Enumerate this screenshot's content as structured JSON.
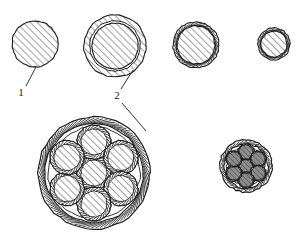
{
  "figure": {
    "background_color": "#ffffff",
    "line_color": "#1a1a1a",
    "hatch_color": "#2b2b2b",
    "strand_fill_light": "#ffffff",
    "strand_fill_dark": "#8e8e8e"
  },
  "callouts": [
    {
      "id": "callout-1",
      "label": "1",
      "label_x": 21,
      "label_y": 96,
      "leader": {
        "x1": 26,
        "y1": 86,
        "x2": 36,
        "y2": 67
      }
    },
    {
      "id": "callout-2",
      "label": "2",
      "label_x": 117,
      "label_y": 99,
      "leader_up": {
        "x1": 121,
        "y1": 89,
        "x2": 133,
        "y2": 70
      },
      "leader_down": {
        "x1": 122,
        "y1": 103,
        "x2": 146,
        "y2": 131
      }
    }
  ],
  "top_row": [
    {
      "id": "conductor-1",
      "name": "bare-conductor",
      "cx": 35,
      "cy": 44,
      "outer_r": 23,
      "core_r": 23,
      "has_sheath": false,
      "has_braid": false,
      "core_fill": "#ffffff"
    },
    {
      "id": "conductor-2",
      "name": "insulated-conductor",
      "cx": 115,
      "cy": 46,
      "outer_r": 31,
      "core_r": 23,
      "has_sheath": true,
      "has_braid": false,
      "core_fill": "#ffffff"
    },
    {
      "id": "conductor-3",
      "name": "braided-conductor-medium",
      "cx": 196,
      "cy": 45,
      "outer_r": 23,
      "core_r": 19,
      "has_sheath": false,
      "has_braid": true,
      "core_fill": "#ffffff"
    },
    {
      "id": "conductor-4",
      "name": "braided-conductor-small",
      "cx": 274,
      "cy": 44,
      "outer_r": 16,
      "core_r": 13,
      "has_sheath": false,
      "has_braid": true,
      "core_fill": "#ffffff"
    }
  ],
  "bottom_row": [
    {
      "id": "cable-large",
      "name": "seven-strand-cable-large",
      "cx": 94,
      "cy": 173,
      "outer_r": 56,
      "sheath_inner_r": 49,
      "strand_r": 17,
      "strand_core_r": 13,
      "ring_radius": 31,
      "strand_count": 7,
      "strand_fill": "#ffffff"
    },
    {
      "id": "cable-small",
      "name": "seven-strand-cable-small",
      "cx": 246,
      "cy": 166,
      "outer_r": 26,
      "sheath_inner_r": 22,
      "strand_r": 8,
      "strand_core_r": 7,
      "ring_radius": 14,
      "strand_count": 7,
      "strand_fill": "#8e8e8e"
    }
  ]
}
